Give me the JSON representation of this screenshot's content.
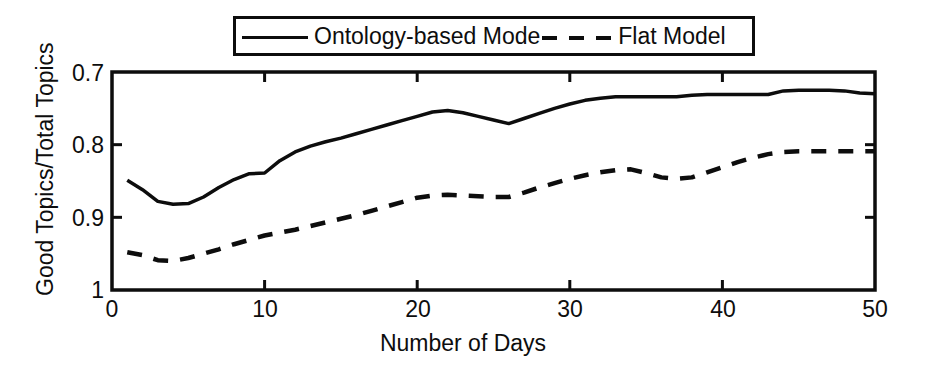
{
  "chart_data": {
    "type": "line",
    "title": "",
    "xlabel": "Number of Days",
    "ylabel": "Good Topics/Total Topics",
    "xlim": [
      0,
      50
    ],
    "ylim": [
      0.7,
      1
    ],
    "xticks": [
      0,
      10,
      20,
      30,
      40,
      50
    ],
    "xtick_labels": [
      "0",
      "10",
      "20",
      "30",
      "40",
      "50"
    ],
    "yticks": [
      0.7,
      0.8,
      0.9,
      1
    ],
    "ytick_labels": [
      "0.7",
      "0.8",
      "0.9",
      "1"
    ],
    "grid": false,
    "legend_position": "top-center",
    "x": [
      1,
      2,
      3,
      4,
      5,
      6,
      7,
      8,
      9,
      10,
      11,
      12,
      13,
      14,
      15,
      16,
      17,
      18,
      19,
      20,
      21,
      22,
      23,
      24,
      25,
      26,
      27,
      28,
      29,
      30,
      31,
      32,
      33,
      34,
      35,
      36,
      37,
      38,
      39,
      40,
      41,
      42,
      43,
      44,
      45,
      46,
      47,
      48,
      49,
      50
    ],
    "series": [
      {
        "name": "Ontology-based Mode",
        "style": "solid",
        "color": "#0d0d0d",
        "values": [
          0.851,
          0.838,
          0.822,
          0.818,
          0.819,
          0.828,
          0.841,
          0.852,
          0.86,
          0.861,
          0.878,
          0.89,
          0.898,
          0.904,
          0.909,
          0.915,
          0.921,
          0.927,
          0.933,
          0.939,
          0.945,
          0.947,
          0.944,
          0.939,
          0.934,
          0.929,
          0.936,
          0.943,
          0.95,
          0.956,
          0.961,
          0.964,
          0.966,
          0.966,
          0.966,
          0.966,
          0.966,
          0.968,
          0.969,
          0.969,
          0.969,
          0.969,
          0.969,
          0.974,
          0.975,
          0.975,
          0.975,
          0.974,
          0.971,
          0.97
        ]
      },
      {
        "name": "Flat Model",
        "style": "dashed",
        "color": "#0d0d0d",
        "values": [
          0.752,
          0.748,
          0.741,
          0.74,
          0.744,
          0.75,
          0.756,
          0.763,
          0.769,
          0.775,
          0.779,
          0.783,
          0.788,
          0.793,
          0.798,
          0.803,
          0.809,
          0.815,
          0.821,
          0.827,
          0.83,
          0.831,
          0.83,
          0.829,
          0.828,
          0.828,
          0.834,
          0.841,
          0.847,
          0.853,
          0.858,
          0.862,
          0.865,
          0.866,
          0.861,
          0.855,
          0.853,
          0.855,
          0.862,
          0.869,
          0.876,
          0.882,
          0.887,
          0.89,
          0.891,
          0.891,
          0.891,
          0.891,
          0.891,
          0.891
        ]
      }
    ]
  },
  "legend": {
    "entries": [
      {
        "label": "Ontology-based Mode",
        "style": "solid"
      },
      {
        "label": "Flat Model",
        "style": "dashed"
      }
    ]
  },
  "axes": {
    "x_title": "Number of Days",
    "y_title": "Good Topics/Total Topics"
  }
}
